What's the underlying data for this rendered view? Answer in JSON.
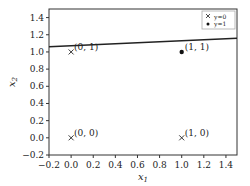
{
  "chart_data": {
    "type": "scatter",
    "title": "",
    "xlabel": "x1",
    "ylabel": "x2",
    "xlim": [
      -0.2,
      1.5
    ],
    "ylim": [
      -0.2,
      1.5
    ],
    "grid": false,
    "legend_position": "upper right",
    "x_ticks": [
      "-0.2",
      "0.0",
      "0.2",
      "0.4",
      "0.6",
      "0.8",
      "1.0",
      "1.2",
      "1.4"
    ],
    "y_ticks": [
      "-0.2",
      "0.0",
      "0.2",
      "0.4",
      "0.6",
      "0.8",
      "1.0",
      "1.2",
      "1.4"
    ],
    "series": [
      {
        "name": "y=0",
        "marker": "x",
        "points": [
          [
            0,
            0
          ],
          [
            0,
            1
          ],
          [
            1,
            0
          ]
        ]
      },
      {
        "name": "y=1",
        "marker": "dot",
        "points": [
          [
            1,
            1
          ]
        ]
      }
    ],
    "decision_line": {
      "x": [
        -0.2,
        1.5
      ],
      "y": [
        1.06,
        1.16
      ]
    },
    "annotations": [
      "(0, 0)",
      "(0, 1)",
      "(1, 0)",
      "(1, 1)"
    ]
  }
}
